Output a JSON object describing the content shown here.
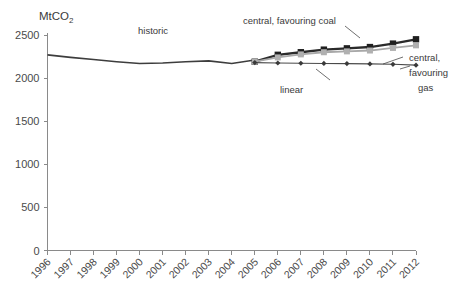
{
  "chart_data": {
    "type": "line",
    "title": "",
    "unit_label": "MtCO",
    "unit_subscript": "2",
    "xlabel": "",
    "ylabel": "MtCO2",
    "ylim": [
      0,
      2500
    ],
    "yticks": [
      0,
      500,
      1000,
      1500,
      2000,
      2500
    ],
    "ytick_labels": [
      "0",
      "500",
      "1000",
      "1500",
      "2000",
      "2500"
    ],
    "xlim": [
      1996,
      2012
    ],
    "xticks": [
      1996,
      1997,
      1998,
      1999,
      2000,
      2001,
      2002,
      2003,
      2004,
      2005,
      2006,
      2007,
      2008,
      2009,
      2010,
      2011,
      2012
    ],
    "xtick_labels": [
      "1996",
      "1997",
      "1998",
      "1999",
      "2000",
      "2001",
      "2002",
      "2003",
      "2004",
      "2005",
      "2006",
      "2007",
      "2008",
      "2009",
      "2010",
      "2011",
      "2012"
    ],
    "grid": false,
    "legend_position": "inline-annotations",
    "series": [
      {
        "name": "historic",
        "marker": "none",
        "color": "#3d3d3d",
        "x": [
          1996,
          1997,
          1998,
          1999,
          2000,
          2001,
          2002,
          2003,
          2004,
          2005
        ],
        "values": [
          2270,
          2240,
          2215,
          2190,
          2170,
          2175,
          2190,
          2200,
          2170,
          2210
        ]
      },
      {
        "name": "central, favouring coal",
        "marker": "square",
        "color": "#2b2b2b",
        "x": [
          2005,
          2006,
          2007,
          2008,
          2009,
          2010,
          2011,
          2012
        ],
        "values": [
          2190,
          2270,
          2300,
          2330,
          2345,
          2360,
          2400,
          2450
        ]
      },
      {
        "name": "central, favouring gas",
        "marker": "square",
        "color": "#b0b0b0",
        "x": [
          2005,
          2006,
          2007,
          2008,
          2009,
          2010,
          2011,
          2012
        ],
        "values": [
          2190,
          2240,
          2275,
          2300,
          2310,
          2320,
          2350,
          2380
        ]
      },
      {
        "name": "linear",
        "marker": "diamond",
        "color": "#4a4a4a",
        "x": [
          2005,
          2006,
          2007,
          2008,
          2009,
          2010,
          2011,
          2012
        ],
        "values": [
          2180,
          2175,
          2172,
          2170,
          2168,
          2165,
          2160,
          2150
        ]
      }
    ],
    "annotations": [
      {
        "text": "historic",
        "series": "historic"
      },
      {
        "text": "central, favouring coal",
        "series": "central, favouring coal"
      },
      {
        "text": "linear",
        "series": "linear"
      },
      {
        "text": "central,",
        "series": "central, favouring gas"
      },
      {
        "text": "favouring",
        "series": "central, favouring gas"
      },
      {
        "text": "gas",
        "series": "central, favouring gas"
      }
    ]
  }
}
